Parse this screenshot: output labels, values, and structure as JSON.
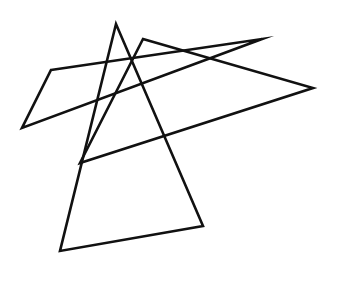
{
  "figure": {
    "background_color": "#ffffff",
    "stroke_color": "#111111",
    "stroke_width": 2.6,
    "fill": "none",
    "width": 342,
    "height": 293,
    "shape_count": 3,
    "shapes": [
      {
        "name": "large-central-triangle",
        "points": "116,24 60,251 203,226",
        "vertices": [
          [
            116,
            24
          ],
          [
            60,
            251
          ],
          [
            203,
            226
          ]
        ],
        "description": "Tall narrow triangle with apex near top center and a wide base tilted down to the left"
      },
      {
        "name": "wide-right-triangle",
        "points": "143,39 313,88 80,163",
        "vertices": [
          [
            143,
            39
          ],
          [
            313,
            88
          ],
          [
            80,
            163
          ]
        ],
        "description": "Long slender triangle sweeping from upper-left bend across to the far right point and back down to the left-middle spike"
      },
      {
        "name": "left-sweeping-triangle",
        "points": "51,70 262,39 22,128",
        "vertices": [
          [
            51,
            70
          ],
          [
            262,
            39
          ],
          [
            22,
            128
          ]
        ],
        "description": "Very flat wide triangle reaching from the left edge up to the sharp upper-right peak"
      }
    ],
    "notable_vertices": [
      {
        "name": "top-apex",
        "x": 116,
        "y": 24
      },
      {
        "name": "upper-left-bend",
        "x": 143,
        "y": 39
      },
      {
        "name": "upper-right-peak",
        "x": 262,
        "y": 39
      },
      {
        "name": "upper-right-notch",
        "x": 254,
        "y": 64
      },
      {
        "name": "left-upper-corner",
        "x": 51,
        "y": 70
      },
      {
        "name": "far-right-point",
        "x": 313,
        "y": 88
      },
      {
        "name": "far-left-point",
        "x": 22,
        "y": 128
      },
      {
        "name": "left-middle-spike",
        "x": 80,
        "y": 163
      },
      {
        "name": "center-lower-spike",
        "x": 183,
        "y": 172
      },
      {
        "name": "bottom-right-corner",
        "x": 203,
        "y": 226
      },
      {
        "name": "bottom-left-corner",
        "x": 60,
        "y": 251
      },
      {
        "name": "bottom-spike",
        "x": 117,
        "y": 283
      }
    ]
  }
}
